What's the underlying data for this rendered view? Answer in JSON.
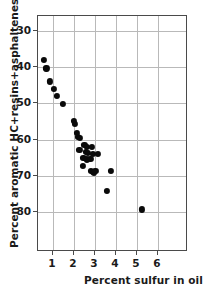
{
  "chart_data": {
    "type": "scatter",
    "title": "",
    "xlabel": "Percent sulfur in oil",
    "ylabel": "Percent aromatic HC+resins+asphaltenes in oil",
    "xlim": [
      0.286,
      7.429
    ],
    "ylim": [
      25.86,
      90.97
    ],
    "y_axis_inverted": true,
    "grid": true,
    "legend": null,
    "xticks": [
      1,
      2,
      3,
      4,
      5,
      6
    ],
    "xtick_labels": [
      "1",
      "2",
      "3",
      "4",
      "5",
      "6"
    ],
    "yticks": [
      30,
      40,
      50,
      60,
      70,
      80
    ],
    "ytick_labels": [
      "30",
      "40",
      "50",
      "60",
      "70",
      "80"
    ],
    "marker": "filled-circle",
    "marker_color": "#0a0a0a",
    "points": [
      {
        "x": 0.55,
        "y": 37.9
      },
      {
        "x": 0.69,
        "y": 40.3
      },
      {
        "x": 0.86,
        "y": 43.9
      },
      {
        "x": 1.05,
        "y": 46.0
      },
      {
        "x": 1.2,
        "y": 47.9
      },
      {
        "x": 1.48,
        "y": 50.2
      },
      {
        "x": 2.0,
        "y": 54.8
      },
      {
        "x": 2.03,
        "y": 55.6
      },
      {
        "x": 2.15,
        "y": 58.2
      },
      {
        "x": 2.2,
        "y": 59.3
      },
      {
        "x": 2.3,
        "y": 59.5
      },
      {
        "x": 2.26,
        "y": 62.7
      },
      {
        "x": 2.5,
        "y": 61.4
      },
      {
        "x": 2.62,
        "y": 62.0
      },
      {
        "x": 2.55,
        "y": 63.3
      },
      {
        "x": 2.68,
        "y": 63.6
      },
      {
        "x": 2.45,
        "y": 64.9
      },
      {
        "x": 2.6,
        "y": 65.4
      },
      {
        "x": 2.78,
        "y": 65.2
      },
      {
        "x": 2.86,
        "y": 62.0
      },
      {
        "x": 2.9,
        "y": 63.8
      },
      {
        "x": 3.12,
        "y": 63.9
      },
      {
        "x": 2.44,
        "y": 67.2
      },
      {
        "x": 2.82,
        "y": 68.6
      },
      {
        "x": 2.9,
        "y": 68.9
      },
      {
        "x": 2.95,
        "y": 69.1
      },
      {
        "x": 3.02,
        "y": 68.6
      },
      {
        "x": 3.75,
        "y": 68.6
      },
      {
        "x": 3.58,
        "y": 74.2
      },
      {
        "x": 5.23,
        "y": 79.2
      }
    ]
  }
}
